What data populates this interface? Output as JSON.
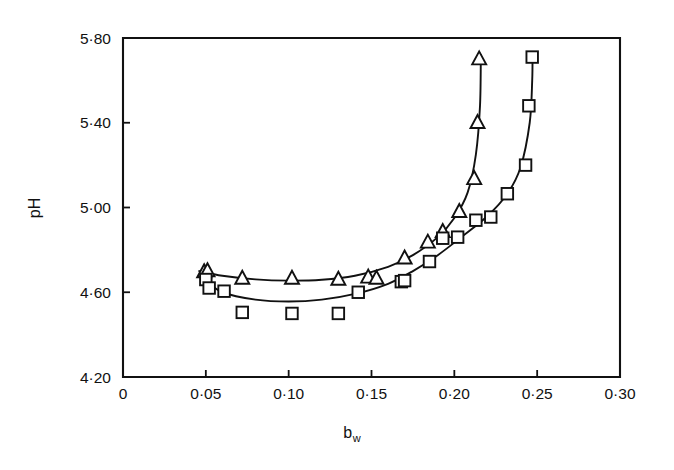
{
  "chart_data": {
    "type": "scatter",
    "title": "",
    "xlabel": "b_w",
    "xlabel_base": "b",
    "xlabel_sub": "w",
    "ylabel": "pH",
    "xlim": [
      0,
      0.3
    ],
    "ylim": [
      4.2,
      5.8
    ],
    "grid": false,
    "legend": "none",
    "x_tick_labels": [
      "0",
      "0·05",
      "0·10",
      "0·15",
      "0·20",
      "0·25",
      "0·30"
    ],
    "x_tick_values": [
      0,
      0.05,
      0.1,
      0.15,
      0.2,
      0.25,
      0.3
    ],
    "y_tick_labels": [
      "4·20",
      "4·60",
      "5·00",
      "5·40",
      "5·80"
    ],
    "y_tick_values": [
      4.2,
      4.6,
      5.0,
      5.4,
      5.8
    ],
    "decimal_separator": "·",
    "series": [
      {
        "name": "triangles",
        "marker": "open-triangle",
        "color": "#111111",
        "points": [
          {
            "x": 0.049,
            "y": 4.695
          },
          {
            "x": 0.051,
            "y": 4.7
          },
          {
            "x": 0.072,
            "y": 4.665
          },
          {
            "x": 0.102,
            "y": 4.665
          },
          {
            "x": 0.13,
            "y": 4.66
          },
          {
            "x": 0.148,
            "y": 4.67
          },
          {
            "x": 0.153,
            "y": 4.665
          },
          {
            "x": 0.17,
            "y": 4.76
          },
          {
            "x": 0.184,
            "y": 4.835
          },
          {
            "x": 0.193,
            "y": 4.885
          },
          {
            "x": 0.203,
            "y": 4.98
          },
          {
            "x": 0.212,
            "y": 5.135
          },
          {
            "x": 0.214,
            "y": 5.4
          },
          {
            "x": 0.215,
            "y": 5.7
          }
        ],
        "fit_curve": [
          {
            "x": 0.046,
            "y": 4.7
          },
          {
            "x": 0.06,
            "y": 4.678
          },
          {
            "x": 0.08,
            "y": 4.661
          },
          {
            "x": 0.1,
            "y": 4.655
          },
          {
            "x": 0.12,
            "y": 4.659
          },
          {
            "x": 0.14,
            "y": 4.678
          },
          {
            "x": 0.16,
            "y": 4.72
          },
          {
            "x": 0.175,
            "y": 4.775
          },
          {
            "x": 0.19,
            "y": 4.86
          },
          {
            "x": 0.2,
            "y": 4.95
          },
          {
            "x": 0.208,
            "y": 5.07
          },
          {
            "x": 0.213,
            "y": 5.25
          },
          {
            "x": 0.2155,
            "y": 5.48
          },
          {
            "x": 0.216,
            "y": 5.72
          }
        ]
      },
      {
        "name": "squares",
        "marker": "open-square",
        "color": "#111111",
        "points": [
          {
            "x": 0.05,
            "y": 4.66
          },
          {
            "x": 0.052,
            "y": 4.62
          },
          {
            "x": 0.061,
            "y": 4.605
          },
          {
            "x": 0.072,
            "y": 4.505
          },
          {
            "x": 0.102,
            "y": 4.5
          },
          {
            "x": 0.13,
            "y": 4.5
          },
          {
            "x": 0.142,
            "y": 4.6
          },
          {
            "x": 0.168,
            "y": 4.65
          },
          {
            "x": 0.17,
            "y": 4.655
          },
          {
            "x": 0.185,
            "y": 4.745
          },
          {
            "x": 0.193,
            "y": 4.855
          },
          {
            "x": 0.202,
            "y": 4.86
          },
          {
            "x": 0.213,
            "y": 4.94
          },
          {
            "x": 0.222,
            "y": 4.955
          },
          {
            "x": 0.232,
            "y": 5.065
          },
          {
            "x": 0.243,
            "y": 5.2
          },
          {
            "x": 0.245,
            "y": 5.48
          },
          {
            "x": 0.247,
            "y": 5.71
          }
        ],
        "fit_curve": [
          {
            "x": 0.048,
            "y": 4.665
          },
          {
            "x": 0.06,
            "y": 4.6
          },
          {
            "x": 0.08,
            "y": 4.565
          },
          {
            "x": 0.1,
            "y": 4.556
          },
          {
            "x": 0.12,
            "y": 4.565
          },
          {
            "x": 0.14,
            "y": 4.592
          },
          {
            "x": 0.16,
            "y": 4.64
          },
          {
            "x": 0.175,
            "y": 4.7
          },
          {
            "x": 0.19,
            "y": 4.775
          },
          {
            "x": 0.205,
            "y": 4.865
          },
          {
            "x": 0.22,
            "y": 4.96
          },
          {
            "x": 0.232,
            "y": 5.065
          },
          {
            "x": 0.24,
            "y": 5.19
          },
          {
            "x": 0.2455,
            "y": 5.4
          },
          {
            "x": 0.247,
            "y": 5.6
          },
          {
            "x": 0.2472,
            "y": 5.73
          }
        ]
      }
    ]
  }
}
